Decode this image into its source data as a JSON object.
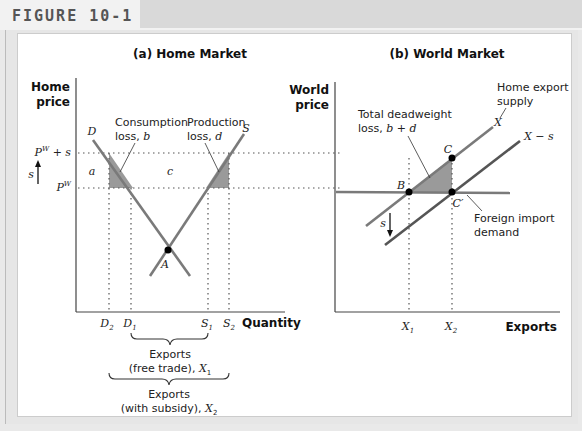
{
  "figure": {
    "label": "FIGURE 10-1"
  },
  "panel_a": {
    "title": "(a) Home Market",
    "y_axis_label_line1": "Home",
    "y_axis_label_line2": "price",
    "x_axis_label": "Quantity",
    "price_high": "P",
    "price_high_sup": "W",
    "price_high_suffix": " + s",
    "price_low": "P",
    "price_low_sup": "W",
    "subsidy_arrow_label": "s",
    "demand_label": "D",
    "supply_label": "S",
    "equilibrium_label": "A",
    "area_a": "a",
    "area_c": "c",
    "consumption_loss_line1": "Consumption",
    "consumption_loss_line2": "loss, ",
    "consumption_loss_var": "b",
    "production_loss_line1": "Production",
    "production_loss_line2": "loss, ",
    "production_loss_var": "d",
    "ticks": [
      {
        "main": "D",
        "sub": "2"
      },
      {
        "main": "D",
        "sub": "1"
      },
      {
        "main": "S",
        "sub": "1"
      },
      {
        "main": "S",
        "sub": "2"
      }
    ],
    "brace_free_trade_line1": "Exports",
    "brace_free_trade_line2": "(free trade), ",
    "brace_free_trade_var": "X",
    "brace_free_trade_sub": "1",
    "brace_subsidy_line1": "Exports",
    "brace_subsidy_line2": "(with subsidy), ",
    "brace_subsidy_var": "X",
    "brace_subsidy_sub": "2"
  },
  "panel_b": {
    "title": "(b) World Market",
    "y_axis_label_line1": "World",
    "y_axis_label_line2": "price",
    "x_axis_label": "Exports",
    "dwl_line1": "Total deadweight",
    "dwl_line2": "loss, ",
    "dwl_var": "b + d",
    "export_supply_line1": "Home export",
    "export_supply_line2": "supply",
    "x_curve_label": "X",
    "x_minus_s_label": "X − s",
    "point_b": "B",
    "point_c": "C",
    "point_c_prime": "C′",
    "subsidy_arrow_label": "s",
    "foreign_demand_line1": "Foreign import",
    "foreign_demand_line2": "demand",
    "ticks": [
      {
        "main": "X",
        "sub": "1"
      },
      {
        "main": "X",
        "sub": "2"
      }
    ]
  },
  "colors": {
    "curve": "#7a7a7a",
    "curve_dark": "#555555",
    "shade": "#9a9a9a",
    "point": "#000000",
    "axis": "#444444"
  }
}
